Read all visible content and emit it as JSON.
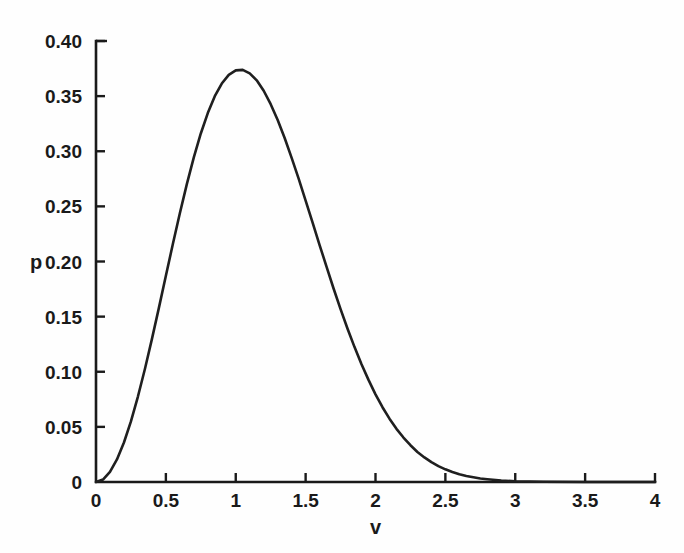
{
  "chart_data": {
    "type": "line",
    "title": "",
    "subtitle": "",
    "xlabel": "v",
    "ylabel": "p",
    "xlim": [
      0,
      4
    ],
    "ylim": [
      0,
      0.4
    ],
    "grid": false,
    "legend": null,
    "x_ticks": [
      0,
      0.5,
      1,
      1.5,
      2,
      2.5,
      3,
      3.5,
      4
    ],
    "x_tick_labels": [
      "0",
      "0.5",
      "1",
      "1.5",
      "2",
      "2.5",
      "3",
      "3.5",
      "4"
    ],
    "y_ticks": [
      0,
      0.05,
      0.1,
      0.15,
      0.2,
      0.25,
      0.3,
      0.35,
      0.4
    ],
    "y_tick_labels": [
      "0",
      "0.05",
      "0.10",
      "0.15",
      "0.20",
      "0.25",
      "0.30",
      "0.35",
      "0.40"
    ],
    "series": [
      {
        "name": "speed distribution",
        "color": "#1f1f1f",
        "x": [
          0,
          0.05,
          0.1,
          0.15,
          0.2,
          0.25,
          0.3,
          0.35,
          0.4,
          0.45,
          0.5,
          0.55,
          0.6,
          0.65,
          0.7,
          0.75,
          0.8,
          0.85,
          0.9,
          0.95,
          1.0,
          1.05,
          1.1,
          1.15,
          1.2,
          1.25,
          1.3,
          1.35,
          1.4,
          1.45,
          1.5,
          1.55,
          1.6,
          1.65,
          1.7,
          1.75,
          1.8,
          1.85,
          1.9,
          1.95,
          2.0,
          2.05,
          2.1,
          2.15,
          2.2,
          2.25,
          2.3,
          2.35,
          2.4,
          2.45,
          2.5,
          2.55,
          2.6,
          2.65,
          2.7,
          2.75,
          2.8,
          2.9,
          3.0,
          3.2,
          3.5,
          4.0
        ],
        "y": [
          0.0,
          0.001,
          0.0041,
          0.0091,
          0.0159,
          0.0244,
          0.0344,
          0.0455,
          0.0575,
          0.0701,
          0.083,
          0.0958,
          0.1082,
          0.1199,
          0.1307,
          0.1403,
          0.1485,
          0.1553,
          0.1604,
          0.1639,
          0.1657,
          0.1659,
          0.1645,
          0.1617,
          0.1575,
          0.1521,
          0.1457,
          0.1385,
          0.1305,
          0.1221,
          0.1133,
          0.1044,
          0.0954,
          0.0866,
          0.0779,
          0.0696,
          0.0617,
          0.0543,
          0.0474,
          0.0411,
          0.0353,
          0.0301,
          0.0255,
          0.0214,
          0.0179,
          0.0148,
          0.0121,
          0.0099,
          0.008,
          0.0064,
          0.0051,
          0.004,
          0.0031,
          0.0024,
          0.0019,
          0.0014,
          0.0011,
          0.0006,
          0.0003,
          0.0001,
          0.0,
          0.0
        ],
        "peak_x": 1.0,
        "peak_y": 0.3738,
        "y_scale_note": "values listed are unnormalized v^2*exp(-v^2) shape; rendered peak equals peak_y"
      }
    ]
  },
  "axis": {
    "x_title": "v",
    "y_title": "p"
  }
}
